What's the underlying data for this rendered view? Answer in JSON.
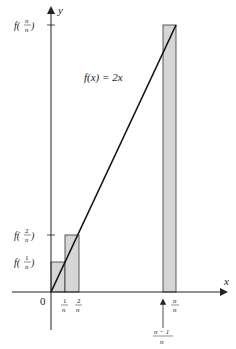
{
  "diagram": {
    "function_label": "f(x) = 2x",
    "axes": {
      "x_label": "x",
      "y_label": "y",
      "origin_label": "0"
    },
    "y_ticks": [
      {
        "f": "f(",
        "num": "n",
        "den": "n",
        "close": ")"
      },
      {
        "f": "f(",
        "num": "2",
        "den": "n",
        "close": ")"
      },
      {
        "f": "f(",
        "num": "1",
        "den": "n",
        "close": ")"
      }
    ],
    "x_ticks": [
      {
        "num": "1",
        "den": "n"
      },
      {
        "num": "2",
        "den": "n"
      },
      {
        "num": "n",
        "den": "n"
      }
    ],
    "arrow_annotation": {
      "num": "n − 1",
      "den": "n"
    },
    "colors": {
      "rect_fill": "#d6d6d6",
      "stroke": "#222222",
      "background": "#ffffff"
    }
  }
}
